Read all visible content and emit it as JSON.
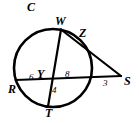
{
  "figure": {
    "type": "circle-geometry-diagram",
    "stroke_color": "#000000",
    "background_color": "#ffffff",
    "circle": {
      "cx": 53,
      "cy": 68,
      "r": 39
    },
    "points": [
      {
        "name": "C",
        "label": "C",
        "x": 27,
        "y": 1,
        "role": "circle-name",
        "size": "major"
      },
      {
        "name": "W",
        "label": "W",
        "x": 55,
        "y": 15,
        "role": "point-on-circle",
        "size": "major"
      },
      {
        "name": "Z",
        "label": "Z",
        "x": 79,
        "y": 27,
        "role": "point-on-circle",
        "size": "major"
      },
      {
        "name": "S",
        "label": "S",
        "x": 124,
        "y": 75,
        "role": "external-point",
        "size": "major"
      },
      {
        "name": "R",
        "label": "R",
        "x": 8,
        "y": 83,
        "role": "point-on-circle",
        "size": "major"
      },
      {
        "name": "Y",
        "label": "Y",
        "x": 37,
        "y": 68,
        "role": "intersection-point",
        "size": "major"
      },
      {
        "name": "T",
        "label": "T",
        "x": 45,
        "y": 107,
        "role": "point-on-circle",
        "size": "major"
      }
    ],
    "measures": [
      {
        "name": "RY",
        "label": "6",
        "x": 29,
        "y": 73,
        "segment": "R to Y"
      },
      {
        "name": "YX",
        "label": "8",
        "x": 65,
        "y": 70,
        "segment": "Y to circle on RS"
      },
      {
        "name": "YT",
        "label": "4",
        "x": 52,
        "y": 86,
        "segment": "Y to T"
      },
      {
        "name": "XS",
        "label": "3",
        "x": 103,
        "y": 79,
        "segment": "circle to S"
      }
    ],
    "segments": [
      {
        "name": "chord-W-T",
        "from": "W",
        "to": "T"
      },
      {
        "name": "secant-R-S",
        "from": "R",
        "to": "S"
      },
      {
        "name": "segment-W-S",
        "from": "W",
        "to": "S"
      }
    ]
  }
}
